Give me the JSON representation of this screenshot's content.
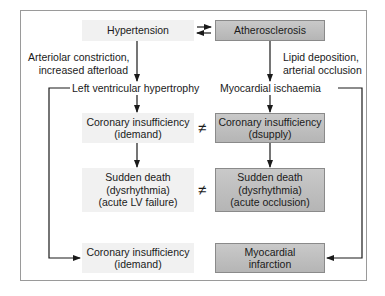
{
  "diagram": {
    "nodes": {
      "hypertension": {
        "label": "Hypertension",
        "style": "light"
      },
      "atherosclerosis": {
        "label": "Atherosclerosis",
        "style": "dark"
      },
      "lvh": {
        "label": "Left ventricular hypertrophy"
      },
      "ischaemia": {
        "label": "Myocardial ischaemia"
      },
      "coronary_demand": {
        "line1": "Coronary insufficiency",
        "line2": "(idemand)",
        "style": "light"
      },
      "coronary_supply": {
        "line1": "Coronary insufficiency",
        "line2": "(dsupply)",
        "style": "dark"
      },
      "sudden_death_left": {
        "line1": "Sudden death",
        "line2": "(dysrhythmia)",
        "line3": "(acute LV failure)",
        "style": "light"
      },
      "sudden_death_right": {
        "line1": "Sudden death",
        "line2": "(dysrhythmia)",
        "line3": "(acute occlusion)",
        "style": "dark"
      },
      "coronary_demand_bottom": {
        "line1": "Coronary insufficiency",
        "line2": "(idemand)",
        "style": "light"
      },
      "mi": {
        "line1": "Myocardial",
        "line2": "infarction",
        "style": "dark"
      }
    },
    "edge_labels": {
      "left_mechanism": {
        "line1": "Arteriolar constriction,",
        "line2": "increased afterload"
      },
      "right_mechanism": {
        "line1": "Lipid deposition,",
        "line2": "arterial occlusion"
      }
    },
    "symbols": {
      "not_equal": "≠"
    },
    "colors": {
      "light_box": "#f1f1f1",
      "dark_box_top": "#c9c9c9",
      "dark_box_bottom": "#b5b5b5",
      "line": "#1a1a1a",
      "frame": "#9a9a9a"
    }
  }
}
